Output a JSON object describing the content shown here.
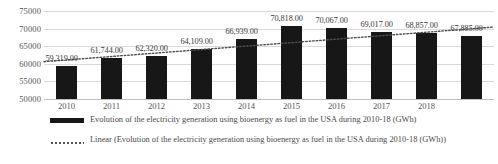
{
  "chart_data": {
    "type": "bar",
    "title": "",
    "xlabel": "",
    "ylabel": "",
    "categories": [
      "2010",
      "2011",
      "2012",
      "2013",
      "2014",
      "2015",
      "2016",
      "2017",
      "2018",
      ""
    ],
    "values": [
      59319,
      61744,
      62320,
      64109,
      66939,
      70818,
      70067,
      69017,
      68857,
      67885
    ],
    "data_labels": [
      "59,319.00",
      "61,744.00",
      "62,320.00",
      "64,109.00",
      "66,939.00",
      "70,818.00",
      "70,067.00",
      "69,017.00",
      "68,857.00",
      "67,885.00"
    ],
    "ylim": [
      50000,
      75000
    ],
    "yticks": [
      75000,
      70000,
      65000,
      60000,
      55000,
      50000
    ],
    "ytick_labels": [
      "75000",
      "70000",
      "65000",
      "60000",
      "55000",
      "50000"
    ],
    "grid": true,
    "legend_position": "bottom",
    "series": [
      {
        "name": "Evolution of the electricity generation using bioenergy as fuel in the USA during 2010-18 (GWh)",
        "type": "bar",
        "color": "#171717",
        "values": [
          59319,
          61744,
          62320,
          64109,
          66939,
          70818,
          70067,
          69017,
          68857,
          67885
        ]
      },
      {
        "name": "Linear (Evolution of the electricity generation using bioenergy as fuel in the USA during 2010-18 (GWh))",
        "type": "trendline-linear",
        "style": "dotted",
        "color": "#4d4d4d",
        "endpoints": [
          60600,
          70450
        ]
      }
    ],
    "annotations": []
  },
  "legend": {
    "items": [
      {
        "marker": "solid-bar",
        "label": "Evolution of the electricity generation using bioenergy as fuel in the USA during 2010-18 (GWh)"
      },
      {
        "marker": "dotted-line",
        "label": "Linear (Evolution of the electricity generation using bioenergy as fuel in the USA during 2010-18 (GWh))"
      }
    ]
  }
}
